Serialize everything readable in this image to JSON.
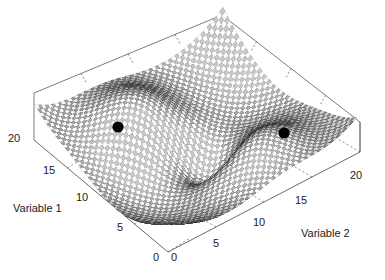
{
  "figure": {
    "type": "surface-plot-3d",
    "background_color": "#ffffff",
    "axis_line_color": "#5a5a5a",
    "marker_color": "#000000",
    "mesh_color": "#3a3a3a",
    "width": 385,
    "height": 280
  },
  "axes": {
    "x": {
      "title": "Variable 1",
      "ticks": [
        "0",
        "5",
        "10",
        "15",
        "20"
      ],
      "min": 0,
      "max": 20
    },
    "y": {
      "title": "Variable 2",
      "ticks": [
        "0",
        "5",
        "10",
        "15",
        "20"
      ],
      "min": 0,
      "max": 20
    }
  },
  "origin": {
    "left_zero": "0",
    "right_zero": "0"
  },
  "tick_positions": {
    "variable1": [
      {
        "label": "20",
        "x": 8,
        "y": 133
      },
      {
        "label": "15",
        "x": 43,
        "y": 165
      },
      {
        "label": "10",
        "x": 76,
        "y": 192
      },
      {
        "label": "5",
        "x": 117,
        "y": 222
      },
      {
        "label": "0",
        "x": 153,
        "y": 252
      }
    ],
    "variable2": [
      {
        "label": "0",
        "x": 171,
        "y": 252
      },
      {
        "label": "5",
        "x": 213,
        "y": 238
      },
      {
        "label": "10",
        "x": 253,
        "y": 217
      },
      {
        "label": "15",
        "x": 295,
        "y": 195
      },
      {
        "label": "20",
        "x": 350,
        "y": 170
      }
    ]
  },
  "axis_title_positions": {
    "variable1": {
      "x": 13,
      "y": 203
    },
    "variable2": {
      "x": 301,
      "y": 228
    }
  },
  "markers": [
    {
      "name": "optimum-left",
      "cx": 118,
      "cy": 127,
      "r": 5.6
    },
    {
      "name": "optimum-right",
      "cx": 284,
      "cy": 133,
      "r": 5.6
    }
  ],
  "chart_data": {
    "type": "surface",
    "title": "",
    "xlabel": "Variable 1",
    "ylabel": "Variable 2",
    "zlabel": "",
    "xlim": [
      0,
      20
    ],
    "ylim": [
      0,
      20
    ],
    "xticks": [
      0,
      5,
      10,
      15,
      20
    ],
    "yticks": [
      0,
      5,
      10,
      15,
      20
    ],
    "grid": false,
    "legend": "none",
    "projection": "isometric",
    "surface_function": "z = 1.15*exp(-((u+0.48)^2+(v+0.30)^2)/0.24) - 1.25*exp(-((u-0.10)^2+(v-0.05)^2)/0.10) + 1.05*exp(-((u-0.50)^2+(v-0.26)^2)/0.22) - 0.55*exp(-((u+0.20)^2+(v-0.55)^2)/0.30) - 0.50*exp(-((u-0.30)^2+(v+0.60)^2)/0.30)",
    "markers": [
      {
        "label": "optimum",
        "x": 4.6,
        "y": 5.2
      },
      {
        "label": "optimum",
        "x": 15.4,
        "y": 14.8
      }
    ],
    "mesh_divisions": 58
  }
}
